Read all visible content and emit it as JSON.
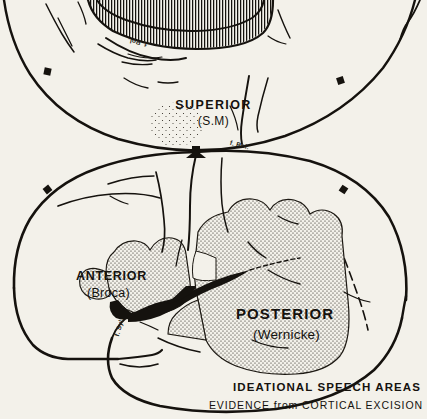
{
  "figure": {
    "background_color": "#f3f1ea",
    "ink_color": "#15120e",
    "caption": {
      "main": "IDEATIONAL SPEECH AREAS",
      "sub": "EVIDENCE from  CORTICAL EXCISION"
    },
    "views": [
      {
        "name": "superior-view",
        "title": "SUPERIOR",
        "subtitle": "(S.M)",
        "description": "Top-down view of the cerebrum showing the longitudinal fissure hatched at the vertex"
      },
      {
        "name": "lateral-view",
        "title": "",
        "subtitle": "",
        "description": "Left lateral view of the cerebral hemisphere with stippled speech areas"
      }
    ],
    "labels": {
      "superior_title": "SUPERIOR",
      "superior_sub": "(S.M)",
      "anterior_title": "ANTERIOR",
      "anterior_sub": "(Broca)",
      "posterior_title": "POSTERIOR",
      "posterior_sub": "(Wernicke)",
      "fissure_rolando_superior": "f. Rol.",
      "fissure_rolando_lateral": "f. Rol.",
      "fissure_sylvius_lateral": "f. Syl."
    },
    "regions": [
      {
        "name": "superior-speech-area",
        "label": "SUPERIOR (S.M)",
        "fill": "stipple",
        "view": "superior-view"
      },
      {
        "name": "anterior-speech-area",
        "label": "ANTERIOR (Broca)",
        "fill": "stipple",
        "view": "lateral-view"
      },
      {
        "name": "posterior-speech-area",
        "label": "POSTERIOR (Wernicke)",
        "fill": "stipple",
        "view": "lateral-view"
      }
    ]
  }
}
